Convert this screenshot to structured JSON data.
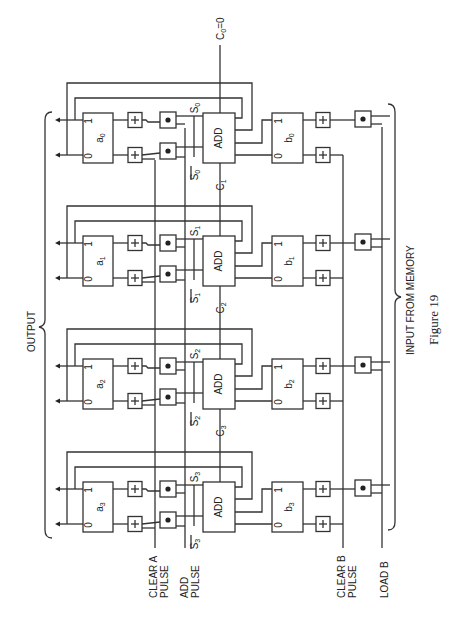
{
  "figure": {
    "caption": "Figure 19",
    "carry_in_label": "C",
    "carry_in_sub": "0",
    "carry_in_value": "=0",
    "output_label": "OUTPUT",
    "input_label": "INPUT FROM MEMORY",
    "control_lines": [
      {
        "id": "clear-a",
        "line1": "CLEAR A",
        "line2": "PULSE"
      },
      {
        "id": "add-pulse",
        "line1": "ADD",
        "line2": "PULSE"
      },
      {
        "id": "clear-b",
        "line1": "CLEAR B",
        "line2": "PULSE"
      },
      {
        "id": "load-b",
        "line1": "LOAD B",
        "line2": ""
      }
    ],
    "stages": [
      {
        "index": "0",
        "a_reg": "a",
        "b_reg": "b",
        "sum": "S",
        "carry_out": "1",
        "adder": "ADD"
      },
      {
        "index": "1",
        "a_reg": "a",
        "b_reg": "b",
        "sum": "S",
        "carry_out": "2",
        "adder": "ADD"
      },
      {
        "index": "2",
        "a_reg": "a",
        "b_reg": "b",
        "sum": "S",
        "carry_out": "3",
        "adder": "ADD"
      },
      {
        "index": "3",
        "a_reg": "a",
        "b_reg": "b",
        "sum": "S",
        "carry_out": "",
        "adder": "ADD"
      }
    ],
    "ff_labels": {
      "one": "1",
      "zero": "0"
    },
    "gate_or_symbol": "+",
    "gate_and_symbol": "•"
  }
}
